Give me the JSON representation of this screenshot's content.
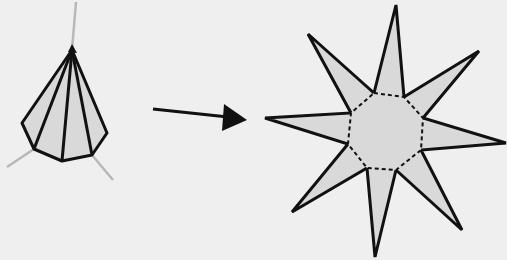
{
  "diagram": {
    "colors": {
      "background": "#efefef",
      "face_fill": "#d9d9d9",
      "edge_stroke": "#111111",
      "axis_stroke": "#b8b8b8"
    },
    "pyramid": {
      "label": "octagonal pyramid",
      "apex": [
        72,
        50
      ],
      "base_points": [
        [
          22,
          123
        ],
        [
          34,
          149
        ],
        [
          62,
          161
        ],
        [
          92,
          155
        ],
        [
          107,
          133
        ]
      ]
    },
    "arrow": {
      "label": "unfolds to",
      "from": [
        153,
        109
      ],
      "to": [
        247,
        120
      ]
    },
    "star_net": {
      "label": "pyramid net",
      "outer_tips": [
        [
          396,
          5
        ],
        [
          479,
          51
        ],
        [
          506,
          143
        ],
        [
          462,
          230
        ],
        [
          375,
          257
        ],
        [
          292,
          212
        ],
        [
          265,
          118
        ],
        [
          308,
          34
        ]
      ],
      "inner_octagon": [
        [
          374,
          93
        ],
        [
          404,
          97
        ],
        [
          423,
          118
        ],
        [
          421,
          150
        ],
        [
          396,
          170
        ],
        [
          367,
          168
        ],
        [
          348,
          144
        ],
        [
          351,
          113
        ]
      ]
    }
  }
}
